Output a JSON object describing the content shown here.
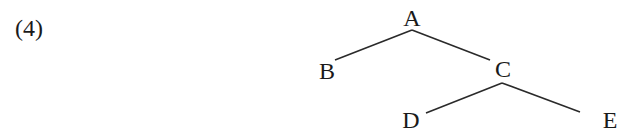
{
  "problem": {
    "number_label": "(4)"
  },
  "tree": {
    "nodes": [
      {
        "id": "A",
        "label": "A"
      },
      {
        "id": "B",
        "label": "B"
      },
      {
        "id": "C",
        "label": "C"
      },
      {
        "id": "D",
        "label": "D"
      },
      {
        "id": "E",
        "label": "E"
      }
    ],
    "edges": [
      {
        "from": "A",
        "to": "B"
      },
      {
        "from": "A",
        "to": "C"
      },
      {
        "from": "C",
        "to": "D"
      },
      {
        "from": "C",
        "to": "E"
      }
    ]
  }
}
